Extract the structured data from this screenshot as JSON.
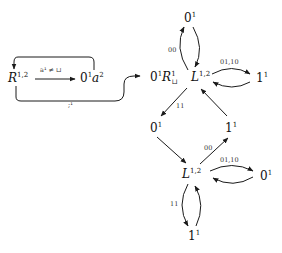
{
  "diagram": {
    "nodes": {
      "r12": {
        "base": "R",
        "sup": "1,2"
      },
      "n0a2": {
        "pre": "0",
        "pre_sup": "1",
        "base": "a",
        "sup": "2"
      },
      "n0R": {
        "pre": "0",
        "pre_sup": "1",
        "base": "R",
        "sup": "1",
        "sub": "⊔"
      },
      "l_top": {
        "base": "L",
        "sup": "1,2"
      },
      "zero_top": {
        "base": "0",
        "sup": "1"
      },
      "one_right_top": {
        "base": "1",
        "sup": "1"
      },
      "zero_mid": {
        "base": "0",
        "sup": "1"
      },
      "one_mid": {
        "base": "1",
        "sup": "1"
      },
      "l_bot": {
        "base": "L",
        "sup": "1,2"
      },
      "zero_right_bot": {
        "base": "0",
        "sup": "1"
      },
      "one_bot": {
        "base": "1",
        "sup": "1"
      }
    },
    "edges": {
      "r_to_0a2": "a¹ ≠ ⊔",
      "bottom_to_0R": ";¹",
      "loop_top": "00",
      "ltop_right": "01,10",
      "ltop_to_zero": "11",
      "one_to_lbot": "00",
      "lbot_right": "01,10",
      "lbot_to_one": "11"
    }
  }
}
